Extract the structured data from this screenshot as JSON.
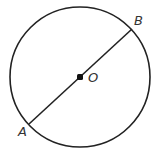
{
  "diagram": {
    "type": "circle-with-diameter",
    "circle": {
      "cx": 80,
      "cy": 77,
      "r": 70,
      "stroke": "#222222"
    },
    "center": {
      "label": "O",
      "x": 80,
      "y": 77
    },
    "points": [
      {
        "label": "A",
        "x": 29,
        "y": 124
      },
      {
        "label": "B",
        "x": 132,
        "y": 29
      }
    ],
    "segments": [
      {
        "from": "A",
        "to": "B",
        "role": "diameter"
      }
    ],
    "labels": {
      "A": "A",
      "B": "B",
      "O": "O"
    }
  }
}
